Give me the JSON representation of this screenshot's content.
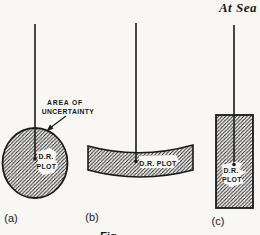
{
  "page": {
    "header": "At Sea",
    "colors": {
      "paper": "#f8f7f3",
      "ink": "#1a1a1a"
    }
  },
  "diagram": {
    "annotation": {
      "line1": "AREA OF",
      "line2": "UNCERTAINTY"
    },
    "panels": {
      "a": {
        "label": "(a)",
        "shape": "hatched-circle",
        "plot_line1": "D.R.",
        "plot_line2": "PLOT"
      },
      "b": {
        "label": "(b)",
        "shape": "hatched-curved-band",
        "plot": "D.R. PLOT"
      },
      "c": {
        "label": "(c)",
        "shape": "hatched-rectangle",
        "plot_line1": "D.R.",
        "plot_line2": "PLOT"
      }
    },
    "caption_partial": "Fig."
  }
}
